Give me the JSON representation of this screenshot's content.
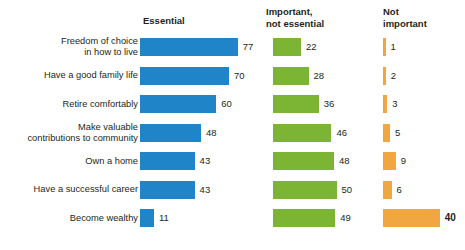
{
  "chart_data": {
    "type": "bar",
    "title": "",
    "subtitle": "",
    "xlabel": "",
    "ylabel": "",
    "orientation": "horizontal",
    "grouping": "grouped-columns",
    "grid": false,
    "legend_position": "top-as-column-headers",
    "xlim": [
      0,
      100
    ],
    "units": "percent",
    "categories": [
      "Freedom of choice\nin how to live",
      "Have a good family life",
      "Retire comfortably",
      "Make valuable\ncontributions to community",
      "Own a home",
      "Have a successful career",
      "Become wealthy"
    ],
    "series": [
      {
        "name": "Essential",
        "color": "#1f85c8",
        "values": [
          77,
          70,
          60,
          48,
          43,
          43,
          11
        ]
      },
      {
        "name": "Important,\nnot essential",
        "color": "#7cb533",
        "values": [
          22,
          28,
          36,
          46,
          48,
          50,
          49
        ]
      },
      {
        "name": "Not\nimportant",
        "color": "#f0a742",
        "values": [
          1,
          2,
          3,
          5,
          9,
          6,
          40
        ]
      }
    ],
    "emphasized_points": [
      {
        "series": "Not important",
        "category": "Become wealthy",
        "value": 40
      }
    ]
  },
  "headers": {
    "essential": "Essential",
    "important": "Important,\nnot essential",
    "not_important": "Not\nimportant"
  },
  "rows": [
    {
      "label": "Freedom of choice\nin how to live",
      "essential": "77",
      "important": "22",
      "not_important": "1"
    },
    {
      "label": "Have a good family life",
      "essential": "70",
      "important": "28",
      "not_important": "2"
    },
    {
      "label": "Retire comfortably",
      "essential": "60",
      "important": "36",
      "not_important": "3"
    },
    {
      "label": "Make valuable\ncontributions to community",
      "essential": "48",
      "important": "46",
      "not_important": "5"
    },
    {
      "label": "Own a home",
      "essential": "43",
      "important": "48",
      "not_important": "9"
    },
    {
      "label": "Have a successful career",
      "essential": "43",
      "important": "50",
      "not_important": "6"
    },
    {
      "label": "Become wealthy",
      "essential": "11",
      "important": "49",
      "not_important": "40"
    }
  ],
  "colors": {
    "essential": "#1f85c8",
    "important": "#7cb533",
    "not_important": "#f0a742",
    "text": "#231f20",
    "background": "#ffffff"
  }
}
